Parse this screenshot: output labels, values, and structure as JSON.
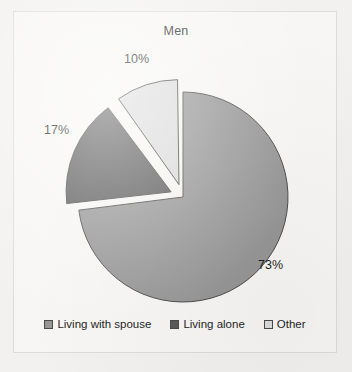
{
  "figure": {
    "background_color": "#f2f1ef",
    "frame_color": "#dedcd8",
    "plot_background_color": "#f7f6f4"
  },
  "chart_data": {
    "type": "pie",
    "title": "Men",
    "xlabel": "",
    "ylabel": "",
    "categories": [
      "Living with spouse",
      "Living alone",
      "Other"
    ],
    "values": [
      73,
      17,
      10
    ],
    "value_unit": "%",
    "data_labels": [
      "73%",
      "17%",
      "10%"
    ],
    "colors": [
      "#969696",
      "#5a5a5a",
      "#dcdcdc"
    ],
    "slice_border_color": "#4a4a4a",
    "start_angle_deg": 0,
    "direction": "clockwise",
    "exploded": [
      false,
      true,
      true
    ],
    "legend_position": "bottom",
    "grid": false,
    "slices": [
      {
        "label": "Living with spouse",
        "value": 73,
        "data_label": "73%",
        "color": "#969696",
        "exploded": false,
        "start_angle_deg": 0,
        "sweep_angle_deg": 262.8
      },
      {
        "label": "Living alone",
        "value": 17,
        "data_label": "17%",
        "color": "#5a5a5a",
        "exploded": true,
        "start_angle_deg": 262.8,
        "sweep_angle_deg": 61.2
      },
      {
        "label": "Other",
        "value": 10,
        "data_label": "10%",
        "color": "#dcdcdc",
        "exploded": true,
        "start_angle_deg": 324.0,
        "sweep_angle_deg": 36.0
      }
    ]
  },
  "legend": {
    "items": [
      {
        "label": "Living with spouse",
        "color": "#969696"
      },
      {
        "label": "Living alone",
        "color": "#5a5a5a"
      },
      {
        "label": "Other",
        "color": "#dcdcdc"
      }
    ]
  }
}
